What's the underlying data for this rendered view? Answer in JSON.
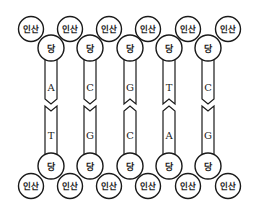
{
  "diagram": {
    "labels": {
      "phosphate": "인산",
      "sugar": "당"
    },
    "colors": {
      "stroke": "#1a1a1a",
      "fill": "#ffffff"
    },
    "top_strand": {
      "phosphates": [
        {
          "label": "인산",
          "cx": 31,
          "cy": 29
        },
        {
          "label": "인산",
          "cx": 70,
          "cy": 29
        },
        {
          "label": "인산",
          "cx": 109,
          "cy": 29
        },
        {
          "label": "인산",
          "cx": 148,
          "cy": 29
        },
        {
          "label": "인산",
          "cx": 188,
          "cy": 29
        },
        {
          "label": "인산",
          "cx": 228,
          "cy": 29
        }
      ],
      "sugars": [
        {
          "label": "당",
          "cx": 51,
          "cy": 48
        },
        {
          "label": "당",
          "cx": 90,
          "cy": 48
        },
        {
          "label": "당",
          "cx": 130,
          "cy": 48
        },
        {
          "label": "당",
          "cx": 169,
          "cy": 48
        },
        {
          "label": "당",
          "cx": 208,
          "cy": 48
        }
      ],
      "bases": [
        "A",
        "C",
        "G",
        "T",
        "C"
      ]
    },
    "bottom_strand": {
      "phosphates": [
        {
          "label": "인산",
          "cx": 31,
          "cy": 186
        },
        {
          "label": "인산",
          "cx": 70,
          "cy": 186
        },
        {
          "label": "인산",
          "cx": 109,
          "cy": 186
        },
        {
          "label": "인산",
          "cx": 148,
          "cy": 186
        },
        {
          "label": "인산",
          "cx": 188,
          "cy": 186
        },
        {
          "label": "인산",
          "cx": 228,
          "cy": 186
        }
      ],
      "sugars": [
        {
          "label": "당",
          "cx": 51,
          "cy": 166
        },
        {
          "label": "당",
          "cx": 90,
          "cy": 166
        },
        {
          "label": "당",
          "cx": 130,
          "cy": 166
        },
        {
          "label": "당",
          "cx": 169,
          "cy": 166
        },
        {
          "label": "당",
          "cx": 208,
          "cy": 166
        }
      ],
      "bases": [
        "T",
        "G",
        "C",
        "A",
        "G"
      ]
    },
    "base_pairs": [
      {
        "top": "A",
        "bottom": "T",
        "joint": "v"
      },
      {
        "top": "C",
        "bottom": "G",
        "joint": "v"
      },
      {
        "top": "G",
        "bottom": "C",
        "joint": "notch"
      },
      {
        "top": "T",
        "bottom": "A",
        "joint": "notch"
      },
      {
        "top": "C",
        "bottom": "G",
        "joint": "v"
      }
    ]
  }
}
